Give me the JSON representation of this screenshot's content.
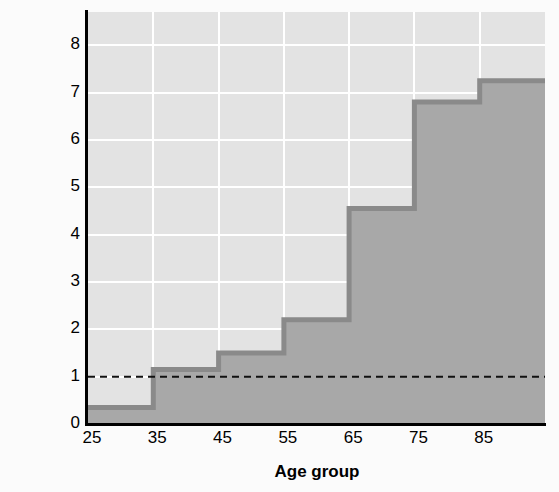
{
  "chart_data": {
    "type": "area",
    "subtype": "step-area",
    "title": "",
    "xlabel": "Age group",
    "ylabel": "Ratio of lung cancer rates in 2005 vs. 1950",
    "ylabel_lines": [
      "Ratio of lung cancer rates in",
      "2005 vs. 1950"
    ],
    "categories": [
      "25",
      "35",
      "45",
      "55",
      "65",
      "75",
      "85"
    ],
    "x": [
      25,
      35,
      45,
      55,
      65,
      75,
      85,
      95
    ],
    "values": [
      0.35,
      1.15,
      1.5,
      2.2,
      4.55,
      6.8,
      7.25
    ],
    "series": [
      {
        "name": "Ratio of lung cancer rates 2005 vs 1950",
        "values": [
          0.35,
          1.15,
          1.5,
          2.2,
          4.55,
          6.8,
          7.25
        ]
      }
    ],
    "xlim": [
      25,
      95
    ],
    "ylim": [
      0,
      8.7
    ],
    "xticks": [
      25,
      35,
      45,
      55,
      65,
      75,
      85
    ],
    "yticks": [
      0,
      1,
      2,
      3,
      4,
      5,
      6,
      7,
      8
    ],
    "xtick_labels": [
      "25",
      "35",
      "45",
      "55",
      "65",
      "75",
      "85"
    ],
    "ytick_labels": [
      "0",
      "1",
      "2",
      "3",
      "4",
      "5",
      "6",
      "7",
      "8"
    ],
    "grid": true,
    "grid_color": "#ffffff",
    "plot_background": "#e3e3e3",
    "fill_color": "#a8a8a8",
    "line_color": "#8a8a8a",
    "reference_line": {
      "value": 1,
      "style": "dashed",
      "color": "#111111",
      "label": ""
    },
    "legend": null
  },
  "axis": {
    "y_title_line1": "Ratio of lung cancer rates in",
    "y_title_line2": "2005 vs. 1950",
    "x_title": "Age group"
  }
}
